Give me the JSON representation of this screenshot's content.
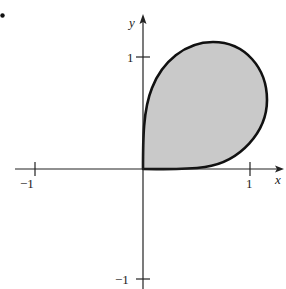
{
  "figure": {
    "bullet": "•",
    "axes": {
      "x_label": "x",
      "y_label": "y",
      "x_ticks": [
        {
          "value": -1,
          "label": "−1"
        },
        {
          "value": 1,
          "label": "1"
        }
      ],
      "y_ticks": [
        {
          "value": 1,
          "label": "1"
        },
        {
          "value": -1,
          "label": "−1"
        }
      ],
      "xlim": [
        -1.2,
        1.3
      ],
      "ylim": [
        -1.0,
        1.3
      ]
    },
    "region": {
      "description": "Shaded teardrop-shaped closed curve in the first quadrant, passing through the origin, tangent to both axes at the origin",
      "fill_color": "#c8c8c8",
      "stroke_color": "#111111"
    }
  }
}
